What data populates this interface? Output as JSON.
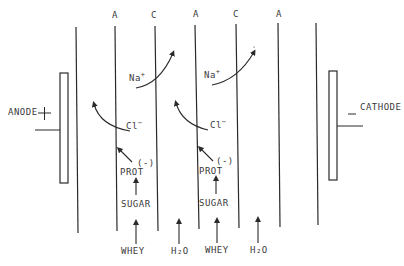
{
  "diagram": {
    "electrodes": {
      "anode": {
        "label": "ANODE",
        "sign": "+"
      },
      "cathode": {
        "label": "CATHODE",
        "sign": "−"
      }
    },
    "membrane_labels": [
      "A",
      "C",
      "A",
      "C",
      "A"
    ],
    "ions": {
      "cation": {
        "symbol": "Na",
        "charge": "+"
      },
      "anion": {
        "symbol": "Cl",
        "charge": "−"
      }
    },
    "components": {
      "protein": "PROT",
      "protein_charge": "(-)",
      "sugar": "SUGAR",
      "feed": "WHEY",
      "water": "H₂O"
    },
    "colors": {
      "line": "#2a2a2a",
      "text": "#3a3a3a",
      "background": "#ffffff"
    }
  }
}
